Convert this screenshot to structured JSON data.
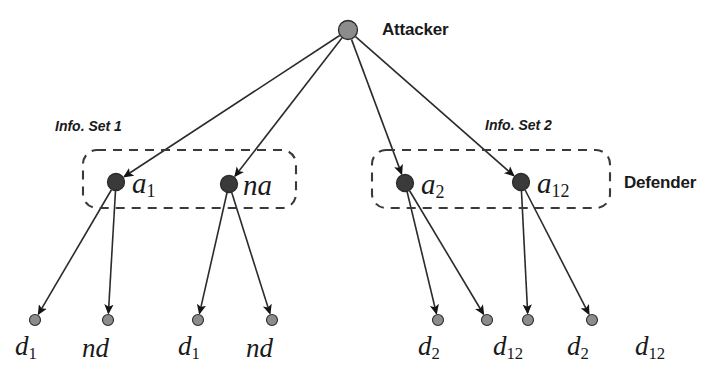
{
  "figure": {
    "type": "game-tree-diagram",
    "colors": {
      "edge": "#2b2b2b",
      "decision_node_fill": "#3a3a3a",
      "root_node_fill": "#8c8c8c",
      "leaf_node_fill": "#8c8c8c",
      "infoset_border": "#3a3a3a",
      "text": "#1a1a1a",
      "background": "#ffffff"
    }
  },
  "players": {
    "root": {
      "label": "Attacker",
      "x": 348,
      "y": 30,
      "label_x": 382,
      "label_y": 20
    },
    "second": {
      "label": "Defender",
      "label_x": 624,
      "label_y": 173
    }
  },
  "info_sets": [
    {
      "name": "Info. Set 1",
      "label_x": 55,
      "label_y": 118,
      "box": {
        "x": 83,
        "y": 150,
        "w": 213,
        "h": 58
      }
    },
    {
      "name": "Info. Set 2",
      "label_x": 485,
      "label_y": 117,
      "box": {
        "x": 372,
        "y": 150,
        "w": 238,
        "h": 58
      }
    }
  ],
  "decision_nodes": [
    {
      "id": "n1",
      "label": "a",
      "sub": "1",
      "x": 116,
      "y": 182,
      "label_x": 132,
      "label_y": 169
    },
    {
      "id": "n2",
      "label": "na",
      "sub": "",
      "x": 229,
      "y": 184,
      "label_x": 243,
      "label_y": 171
    },
    {
      "id": "n3",
      "label": "a",
      "sub": "2",
      "x": 405,
      "y": 183,
      "label_x": 421,
      "label_y": 170
    },
    {
      "id": "n4",
      "label": "a",
      "sub": "12",
      "x": 521,
      "y": 182,
      "label_x": 537,
      "label_y": 169
    }
  ],
  "leaf_nodes": [
    {
      "id": "l1",
      "parent": "n1",
      "label": "d",
      "sub": "1",
      "x": 35,
      "y": 320,
      "label_x": 15,
      "label_y": 333
    },
    {
      "id": "l2",
      "parent": "n1",
      "label": "nd",
      "sub": "",
      "x": 108,
      "y": 320,
      "label_x": 82,
      "label_y": 335
    },
    {
      "id": "l3",
      "parent": "n2",
      "label": "d",
      "sub": "1",
      "x": 198,
      "y": 320,
      "label_x": 178,
      "label_y": 333
    },
    {
      "id": "l4",
      "parent": "n2",
      "label": "nd",
      "sub": "",
      "x": 272,
      "y": 320,
      "label_x": 246,
      "label_y": 335
    },
    {
      "id": "l5",
      "parent": "n3",
      "label": "d",
      "sub": "2",
      "x": 438,
      "y": 320,
      "label_x": 418,
      "label_y": 333
    },
    {
      "id": "l6",
      "parent": "n3",
      "label": "d",
      "sub": "12",
      "x": 487,
      "y": 320,
      "label_x": 493,
      "label_y": 333
    },
    {
      "id": "l7",
      "parent": "n4",
      "label": "d",
      "sub": "2",
      "x": 528,
      "y": 320,
      "label_x": 567,
      "label_y": 333
    },
    {
      "id": "l8",
      "parent": "n4",
      "label": "d",
      "sub": "12",
      "x": 592,
      "y": 320,
      "label_x": 635,
      "label_y": 333
    }
  ],
  "edges": [
    {
      "from": "root",
      "to": "n1"
    },
    {
      "from": "root",
      "to": "n2"
    },
    {
      "from": "root",
      "to": "n3"
    },
    {
      "from": "root",
      "to": "n4"
    },
    {
      "from": "n1",
      "to": "l1"
    },
    {
      "from": "n1",
      "to": "l2"
    },
    {
      "from": "n2",
      "to": "l3"
    },
    {
      "from": "n2",
      "to": "l4"
    },
    {
      "from": "n3",
      "to": "l5"
    },
    {
      "from": "n3",
      "to": "l6"
    },
    {
      "from": "n4",
      "to": "l7"
    },
    {
      "from": "n4",
      "to": "l8"
    }
  ]
}
